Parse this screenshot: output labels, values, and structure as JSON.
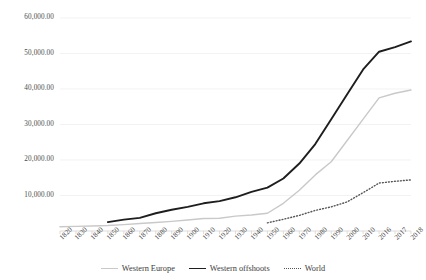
{
  "chart_data": {
    "type": "line",
    "title": "",
    "subtitle": "",
    "xlabel": "",
    "ylabel": "",
    "grid": true,
    "legend_position": "bottom",
    "ylim": [
      0,
      60000
    ],
    "y_ticks": [
      10000,
      20000,
      30000,
      40000,
      50000,
      60000
    ],
    "y_tick_labels": [
      "10,000.00",
      "20,000.00",
      "30,000.00",
      "40,000.00",
      "50,000.00",
      "60,000.00"
    ],
    "categories": [
      "1820",
      "1830",
      "1840",
      "1850",
      "1860",
      "1870",
      "1880",
      "1890",
      "1900",
      "1910",
      "1920",
      "1930",
      "1940",
      "1950",
      "1960",
      "1970",
      "1980",
      "1990",
      "2000",
      "2010",
      "2016",
      "2017",
      "2018"
    ],
    "series": [
      {
        "name": "Western Europe",
        "color": "#c9c9c9",
        "style": "solid",
        "width": 1.4,
        "values": [
          1200,
          1300,
          1400,
          1550,
          1800,
          2100,
          2400,
          2700,
          3100,
          3500,
          3600,
          4200,
          4500,
          5000,
          7800,
          11500,
          15800,
          19500,
          25500,
          31500,
          37500,
          38800,
          39700
        ]
      },
      {
        "name": "Western offshoots",
        "color": "#1e1e1e",
        "style": "solid",
        "width": 1.9,
        "values": [
          null,
          null,
          null,
          2500,
          3200,
          3700,
          5000,
          6000,
          6800,
          7800,
          8400,
          9500,
          11000,
          12200,
          14800,
          19000,
          24500,
          31500,
          38500,
          45500,
          50500,
          51800,
          53400
        ]
      },
      {
        "name": "World",
        "color": "#555555",
        "style": "dotted",
        "width": 1.4,
        "values": [
          null,
          null,
          null,
          null,
          null,
          null,
          null,
          null,
          null,
          null,
          null,
          null,
          null,
          2300,
          3300,
          4400,
          5800,
          6800,
          8200,
          10800,
          13500,
          14000,
          14400
        ]
      }
    ]
  },
  "legend": {
    "items": [
      {
        "label": "Western Europe"
      },
      {
        "label": "Western offshoots"
      },
      {
        "label": "World"
      }
    ]
  }
}
